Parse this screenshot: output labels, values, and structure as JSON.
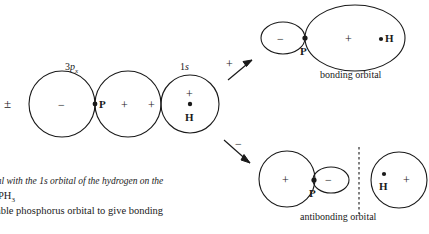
{
  "diagram": {
    "reactants": {
      "p_orbital": {
        "label_prefix": "3",
        "label_italic": "p",
        "label_subscript": "x",
        "full_label": "3px",
        "pm_sign": "±",
        "left_lobe_sign": "−",
        "right_lobe_sign": "+",
        "nucleus_label": "P"
      },
      "plus_operator": "+",
      "s_orbital": {
        "label_prefix": "1",
        "label_italic": "s",
        "full_label": "1s",
        "sign": "+",
        "nucleus_label": "H"
      }
    },
    "arrows": {
      "upper": {
        "sign": "+",
        "direction": "up-right"
      },
      "lower": {
        "sign": "−",
        "direction": "down-right"
      }
    },
    "bonding": {
      "caption": "bonding orbital",
      "small_lobe_sign": "−",
      "large_lobe_sign": "+",
      "p_label": "P",
      "h_label": "H"
    },
    "antibonding": {
      "caption": "antibonding orbital",
      "large_lobe_sign": "+",
      "small_lobe_sign": "−",
      "p_label": "P",
      "h_label": "H",
      "right_lobe_sign": "+",
      "node_style": "dashed"
    }
  },
  "figure_caption": {
    "line1": "tal with the 1s orbital of the hydrogen on the",
    "line1_italic_head": "tal with the 1",
    "line1_italic_s": "s",
    "line1_italic_tail": " orbital of the hydrogen on the",
    "line2_text": "PH",
    "line2_subscript": "3",
    "line3": "able phosphorus orbital to give bonding"
  },
  "colors": {
    "stroke": "#1a1a1a",
    "text": "#1a1a1a",
    "background": "#ffffff"
  }
}
